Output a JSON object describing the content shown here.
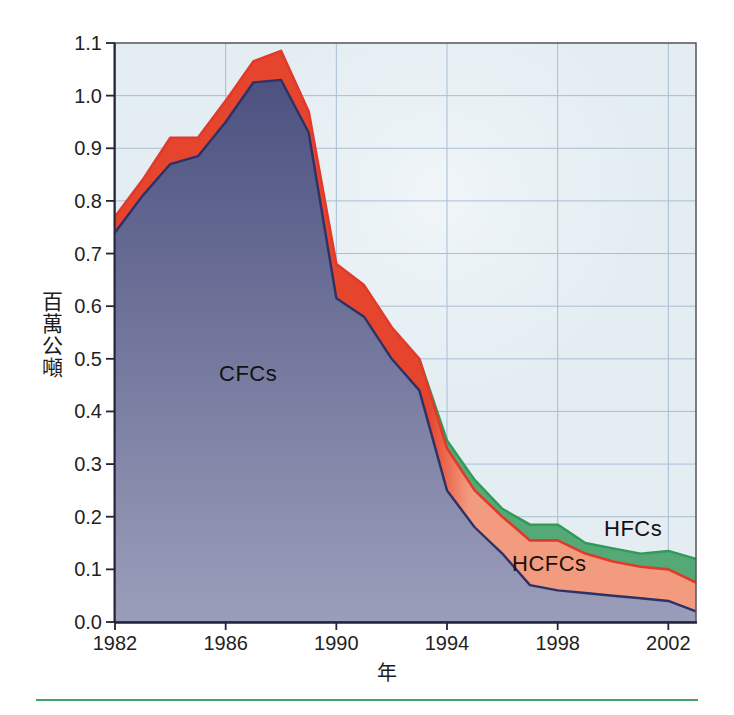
{
  "figure": {
    "y_axis_title": "百萬公噸",
    "x_axis_title": "年",
    "series_labels": {
      "cfc": "CFCs",
      "hcfc": "HCFCs",
      "hfc": "HFCs"
    }
  },
  "chart_data": {
    "type": "area",
    "stacked": true,
    "title": "",
    "xlabel": "年",
    "ylabel": "百萬公噸",
    "xlim": [
      1982,
      2003
    ],
    "ylim": [
      0,
      1.1
    ],
    "grid": true,
    "legend_position": "labels-inside-areas",
    "x": [
      1982,
      1983,
      1984,
      1985,
      1986,
      1987,
      1988,
      1989,
      1990,
      1991,
      1992,
      1993,
      1994,
      1995,
      1996,
      1997,
      1998,
      1999,
      2000,
      2001,
      2002,
      2003
    ],
    "series": [
      {
        "name": "CFCs",
        "values": [
          0.74,
          0.81,
          0.87,
          0.885,
          0.95,
          1.025,
          1.03,
          0.93,
          0.615,
          0.58,
          0.5,
          0.44,
          0.25,
          0.18,
          0.13,
          0.07,
          0.06,
          0.055,
          0.05,
          0.045,
          0.04,
          0.02
        ]
      },
      {
        "name": "HCFCs",
        "values": [
          0.03,
          0.03,
          0.05,
          0.035,
          0.04,
          0.04,
          0.055,
          0.04,
          0.065,
          0.06,
          0.06,
          0.06,
          0.08,
          0.07,
          0.07,
          0.085,
          0.095,
          0.075,
          0.065,
          0.06,
          0.06,
          0.055
        ]
      },
      {
        "name": "HFCs",
        "values": [
          0,
          0,
          0,
          0,
          0,
          0,
          0,
          0,
          0,
          0,
          0,
          0,
          0.015,
          0.02,
          0.015,
          0.03,
          0.03,
          0.02,
          0.025,
          0.025,
          0.035,
          0.045
        ]
      }
    ],
    "x_ticks": [
      "1982",
      "1986",
      "1990",
      "1994",
      "1998",
      "2002"
    ],
    "x_tick_years": [
      1982,
      1986,
      1990,
      1994,
      1998,
      2002
    ],
    "y_ticks": [
      "0.0",
      "0.1",
      "0.2",
      "0.3",
      "0.4",
      "0.5",
      "0.6",
      "0.7",
      "0.8",
      "0.9",
      "1.0",
      "1.1"
    ],
    "colors": {
      "plot_bg": "#e3edf2",
      "grid": "#a9bed4",
      "frame": "#54545c",
      "axis": "#23233a",
      "cfc_fill_top": "#474c7c",
      "cfc_fill_bottom": "#9b9eba",
      "cfc_stroke": "#2c3168",
      "hcfc_fill_early": "#e5452d",
      "hcfc_fill_late": "#f39b7f",
      "hcfc_stroke": "#e2392b",
      "hfc_fill": "#55a976",
      "hfc_stroke": "#2f9b57",
      "tick_text": "#1f1f1f",
      "bottom_rule": "#43a268"
    }
  }
}
